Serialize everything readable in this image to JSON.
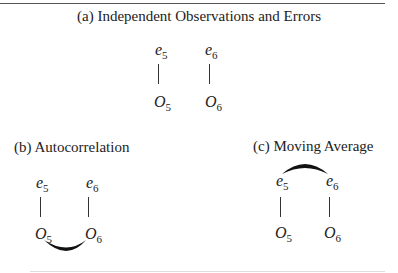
{
  "panels": [
    {
      "id": "a",
      "title": "(a)  Independent Observations and Errors",
      "relation": "none",
      "nodes": {
        "e5": {
          "base": "e",
          "sub": "5"
        },
        "e6": {
          "base": "e",
          "sub": "6"
        },
        "o5": {
          "base": "O",
          "sub": "5"
        },
        "o6": {
          "base": "O",
          "sub": "6"
        }
      }
    },
    {
      "id": "b",
      "title": "(b)  Autocorrelation",
      "relation": "arc connecting O5 and O6 (below)",
      "nodes": {
        "e5": {
          "base": "e",
          "sub": "5"
        },
        "e6": {
          "base": "e",
          "sub": "6"
        },
        "o5": {
          "base": "O",
          "sub": "5"
        },
        "o6": {
          "base": "O",
          "sub": "6"
        }
      }
    },
    {
      "id": "c",
      "title": "(c)  Moving Average",
      "relation": "arc connecting e5 and e6 (above)",
      "nodes": {
        "e5": {
          "base": "e",
          "sub": "5"
        },
        "e6": {
          "base": "e",
          "sub": "6"
        },
        "o5": {
          "base": "O",
          "sub": "5"
        },
        "o6": {
          "base": "O",
          "sub": "6"
        }
      }
    }
  ]
}
